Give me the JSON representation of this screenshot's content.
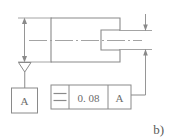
{
  "figure": {
    "label": "b)",
    "line_color": "#8a8a8a",
    "text_color": "#6b6b6b",
    "background": "#ffffff"
  },
  "part": {
    "name": "slotted-block",
    "outline_note": "rectangular block with rectangular slot cut into right side",
    "centerline": "dash-dot horizontal axis"
  },
  "datum": {
    "symbol_letter": "A",
    "indicator": "open-triangle",
    "box_label": "A"
  },
  "feature_control_frame": {
    "characteristic_symbol": "symmetry",
    "characteristic_glyph": "≡",
    "tolerance_value": "0. 08",
    "datum_reference": "A",
    "cells": [
      {
        "name": "symbol-cell",
        "text": "≡"
      },
      {
        "name": "tolerance-cell",
        "text": "0. 08"
      },
      {
        "name": "datum-cell",
        "text": "A"
      }
    ]
  },
  "dimensions": {
    "left": {
      "name": "overall-height-dimension",
      "style": "double-headed-arrow",
      "value": ""
    },
    "right": {
      "name": "slot-width-dimension",
      "style": "inward-arrows",
      "value": ""
    }
  }
}
